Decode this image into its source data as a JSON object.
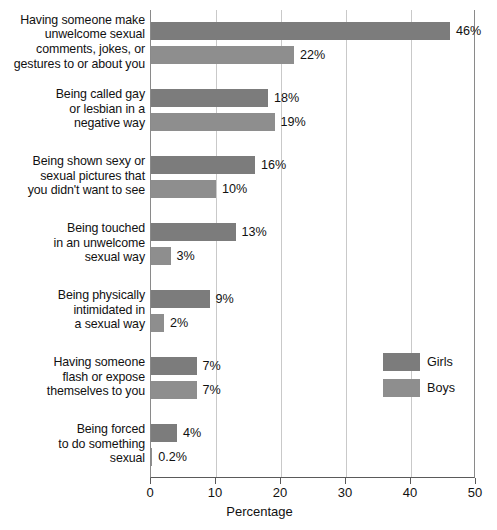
{
  "chart_data": {
    "type": "bar",
    "orientation": "horizontal",
    "title": "",
    "xlabel": "Percentage",
    "ylabel": "",
    "xlim": [
      0,
      50
    ],
    "xticks": [
      0,
      10,
      20,
      30,
      40,
      50
    ],
    "xtick_labels": [
      "0",
      "10",
      "20",
      "30",
      "40",
      "50"
    ],
    "grid": true,
    "grid_axis": "x",
    "legend_position": "right-middle",
    "categories": [
      "Having someone make unwelcome sexual comments, jokes, or gestures to or about you",
      "Being called gay or lesbian in a negative way",
      "Being shown sexy or sexual pictures that you didn't want to see",
      "Being touched in an unwelcome sexual way",
      "Being physically intimidated in a sexual way",
      "Having someone flash or expose themselves to you",
      "Being forced to do something sexual"
    ],
    "category_lines": [
      [
        "Having someone make",
        "unwelcome sexual",
        "comments, jokes, or",
        "gestures to or about you"
      ],
      [
        "Being called gay",
        "or lesbian in a",
        "negative way"
      ],
      [
        "Being shown sexy or",
        "sexual pictures that",
        "you didn't want to see"
      ],
      [
        "Being touched",
        "in an unwelcome",
        "sexual way"
      ],
      [
        "Being physically",
        "intimidated in",
        "a sexual way"
      ],
      [
        "Having someone",
        "flash or expose",
        "themselves to you"
      ],
      [
        "Being forced",
        "to do something",
        "sexual"
      ]
    ],
    "series": [
      {
        "name": "Girls",
        "color": "#7c7c7c",
        "values": [
          46,
          18,
          16,
          13,
          9,
          7,
          4
        ],
        "data_labels": [
          "46%",
          "18%",
          "16%",
          "13%",
          "9%",
          "7%",
          "4%"
        ]
      },
      {
        "name": "Boys",
        "color": "#8e8e8e",
        "values": [
          22,
          19,
          10,
          3,
          2,
          7,
          0.2
        ],
        "data_labels": [
          "22%",
          "19%",
          "10%",
          "3%",
          "2%",
          "7%",
          "0.2%"
        ]
      }
    ]
  },
  "legend": {
    "items": [
      {
        "label": "Girls"
      },
      {
        "label": "Boys"
      }
    ]
  }
}
